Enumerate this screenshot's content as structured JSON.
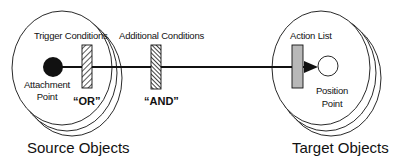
{
  "diagram": {
    "colors": {
      "line": "#111111",
      "background": "#ffffff",
      "action_list_fill": "#b8b8b8"
    },
    "source": {
      "group_label": "Source Objects",
      "trigger_label": "Trigger Conditions",
      "attachment_label_line1": "Attachment",
      "attachment_label_line2": "Point",
      "or_label": "“OR”"
    },
    "middle": {
      "additional_label": "Additional Conditions",
      "and_label": "“AND”"
    },
    "target": {
      "group_label": "Target Objects",
      "action_list_label": "Action List",
      "position_label_line1": "Position",
      "position_label_line2": "Point"
    }
  }
}
